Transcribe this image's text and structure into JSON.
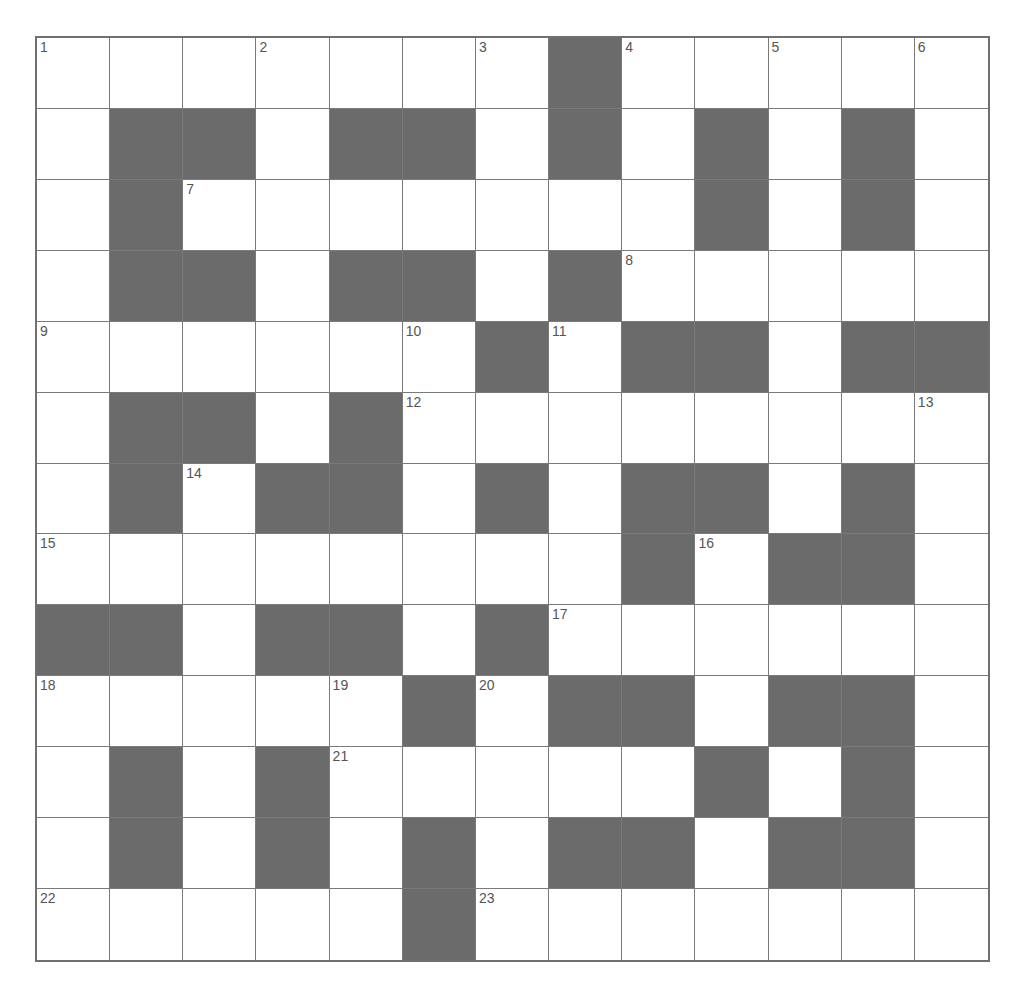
{
  "puzzle": {
    "rows": 13,
    "cols": 13,
    "colors": {
      "block": "#6b6b6b",
      "cell": "#ffffff",
      "line": "#7a7a7a",
      "number": "#555555"
    },
    "layout": [
      ".......#.....",
      ".##.##.#.#.#.",
      ".#.......#.#.",
      ".##.##.#.....",
      "......#.##.##",
      ".##.#........",
      ".#.##.#.##.#.",
      "........#.##.",
      "##.##.#......",
      ".....#.##.##.",
      ".#.#.....#.#.",
      ".#.#.#.##.##.",
      ".....#......."
    ],
    "numbers": [
      {
        "n": "1",
        "r": 0,
        "c": 0
      },
      {
        "n": "2",
        "r": 0,
        "c": 3
      },
      {
        "n": "3",
        "r": 0,
        "c": 6
      },
      {
        "n": "4",
        "r": 0,
        "c": 8
      },
      {
        "n": "5",
        "r": 0,
        "c": 10
      },
      {
        "n": "6",
        "r": 0,
        "c": 12
      },
      {
        "n": "7",
        "r": 2,
        "c": 2
      },
      {
        "n": "8",
        "r": 3,
        "c": 8
      },
      {
        "n": "9",
        "r": 4,
        "c": 0
      },
      {
        "n": "10",
        "r": 4,
        "c": 5
      },
      {
        "n": "11",
        "r": 4,
        "c": 7
      },
      {
        "n": "12",
        "r": 5,
        "c": 5
      },
      {
        "n": "13",
        "r": 5,
        "c": 12
      },
      {
        "n": "14",
        "r": 6,
        "c": 2
      },
      {
        "n": "15",
        "r": 7,
        "c": 0
      },
      {
        "n": "16",
        "r": 7,
        "c": 9
      },
      {
        "n": "17",
        "r": 8,
        "c": 7
      },
      {
        "n": "18",
        "r": 9,
        "c": 0
      },
      {
        "n": "19",
        "r": 9,
        "c": 4
      },
      {
        "n": "20",
        "r": 9,
        "c": 6
      },
      {
        "n": "21",
        "r": 10,
        "c": 4
      },
      {
        "n": "22",
        "r": 12,
        "c": 0
      },
      {
        "n": "23",
        "r": 12,
        "c": 6
      }
    ]
  }
}
